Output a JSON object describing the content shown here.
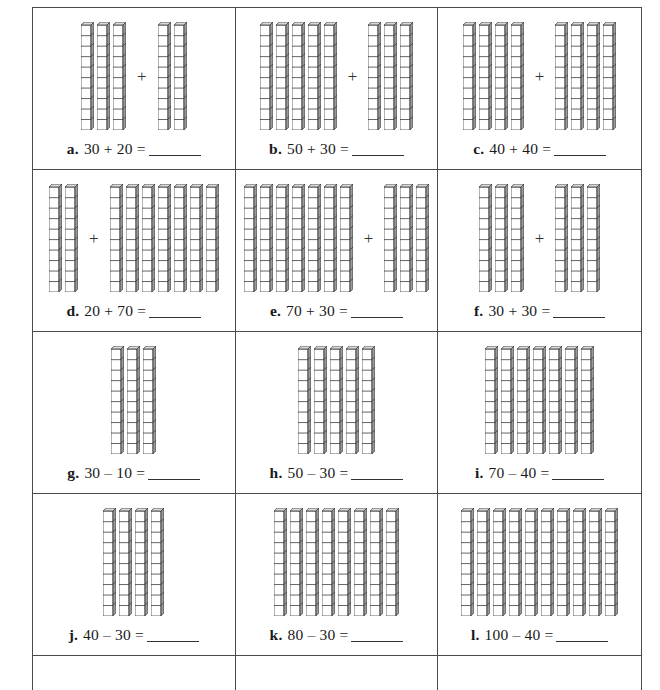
{
  "worksheet": {
    "rod_unit_count": 10,
    "colors": {
      "border": "#4a4a4a",
      "ink": "#1a1a1a",
      "rod_stroke": "#333333",
      "rod_face": "#ffffff",
      "rod_side_shade": "#9a9a9a",
      "rod_top_shade": "#d8d8d8"
    },
    "plus_symbol": "+",
    "blank_placeholder": "",
    "problems": [
      {
        "label": "a.",
        "text": "30 + 20 =",
        "operation": "addition",
        "operands": [
          30,
          20
        ],
        "rod_groups": [
          3,
          2
        ],
        "blank": ""
      },
      {
        "label": "b.",
        "text": "50 + 30 =",
        "operation": "addition",
        "operands": [
          50,
          30
        ],
        "rod_groups": [
          5,
          3
        ],
        "blank": ""
      },
      {
        "label": "c.",
        "text": "40 + 40 =",
        "operation": "addition",
        "operands": [
          40,
          40
        ],
        "rod_groups": [
          4,
          4
        ],
        "blank": ""
      },
      {
        "label": "d.",
        "text": "20 + 70 =",
        "operation": "addition",
        "operands": [
          20,
          70
        ],
        "rod_groups": [
          2,
          7
        ],
        "blank": ""
      },
      {
        "label": "e.",
        "text": "70 + 30 =",
        "operation": "addition",
        "operands": [
          70,
          30
        ],
        "rod_groups": [
          7,
          3
        ],
        "blank": ""
      },
      {
        "label": "f.",
        "text": "30 + 30 =",
        "operation": "addition",
        "operands": [
          30,
          30
        ],
        "rod_groups": [
          3,
          3
        ],
        "blank": ""
      },
      {
        "label": "g.",
        "text": "30 – 10 =",
        "operation": "subtraction",
        "operands": [
          30,
          10
        ],
        "rod_groups": [
          3
        ],
        "blank": ""
      },
      {
        "label": "h.",
        "text": "50 – 30 =",
        "operation": "subtraction",
        "operands": [
          50,
          30
        ],
        "rod_groups": [
          5
        ],
        "blank": ""
      },
      {
        "label": "i.",
        "text": "70 – 40 =",
        "operation": "subtraction",
        "operands": [
          70,
          40
        ],
        "rod_groups": [
          7
        ],
        "blank": ""
      },
      {
        "label": "j.",
        "text": "40 – 30 =",
        "operation": "subtraction",
        "operands": [
          40,
          30
        ],
        "rod_groups": [
          4
        ],
        "blank": ""
      },
      {
        "label": "k.",
        "text": "80 – 30 =",
        "operation": "subtraction",
        "operands": [
          80,
          30
        ],
        "rod_groups": [
          8
        ],
        "blank": ""
      },
      {
        "label": "l.",
        "text": "100 – 40 =",
        "operation": "subtraction",
        "operands": [
          100,
          40
        ],
        "rod_groups": [
          10
        ],
        "blank": ""
      }
    ]
  }
}
